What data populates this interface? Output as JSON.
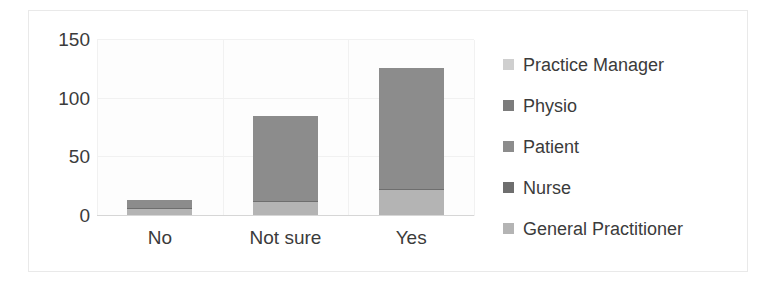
{
  "chart_data": {
    "type": "bar",
    "subtype": "stacked-bar",
    "title": "",
    "xlabel": "",
    "ylabel": "",
    "categories": [
      "No",
      "Not sure",
      "Yes"
    ],
    "ylim": [
      0,
      150
    ],
    "yticks": [
      0,
      50,
      100,
      150
    ],
    "ytick_labels": [
      "0",
      "50",
      "100",
      "150"
    ],
    "grid": {
      "horizontal": true,
      "vertical": true
    },
    "legend_position": "right",
    "stack_order_bottom_to_top": [
      "General Practitioner",
      "Nurse",
      "Patient",
      "Physio",
      "Practice Manager"
    ],
    "series": [
      {
        "name": "General Practitioner",
        "color": "#b4b4b4",
        "values": [
          6,
          12,
          22
        ]
      },
      {
        "name": "Nurse",
        "color": "#6e6e6e",
        "values": [
          1,
          1,
          1
        ]
      },
      {
        "name": "Patient",
        "color": "#8c8c8c",
        "values": [
          7,
          72,
          103
        ]
      },
      {
        "name": "Physio",
        "color": "#7c7c7c",
        "values": [
          0,
          0,
          0
        ]
      },
      {
        "name": "Practice Manager",
        "color": "#cfcfcf",
        "values": [
          0,
          0,
          0
        ]
      }
    ],
    "totals": [
      14,
      85,
      126
    ]
  },
  "yaxis": {
    "ticks": [
      {
        "label": "150",
        "value": 150
      },
      {
        "label": "100",
        "value": 100
      },
      {
        "label": "50",
        "value": 50
      },
      {
        "label": "0",
        "value": 0
      }
    ]
  },
  "xaxis": {
    "ticks": [
      {
        "label": "No"
      },
      {
        "label": "Not sure"
      },
      {
        "label": "Yes"
      }
    ]
  },
  "legend": {
    "items": [
      {
        "label": "Practice Manager",
        "color": "#cfcfcf"
      },
      {
        "label": "Physio",
        "color": "#7c7c7c"
      },
      {
        "label": "Patient",
        "color": "#8c8c8c"
      },
      {
        "label": "Nurse",
        "color": "#6e6e6e"
      },
      {
        "label": "General Practitioner",
        "color": "#b4b4b4"
      }
    ]
  },
  "colors": {
    "background": "#ffffff",
    "plot_background": "#fdfdfd",
    "gridline": "#f1f1f1",
    "axis_line": "#d6d6d6",
    "text": "#3b3b3b",
    "frame_border": "#e9e9e9"
  }
}
